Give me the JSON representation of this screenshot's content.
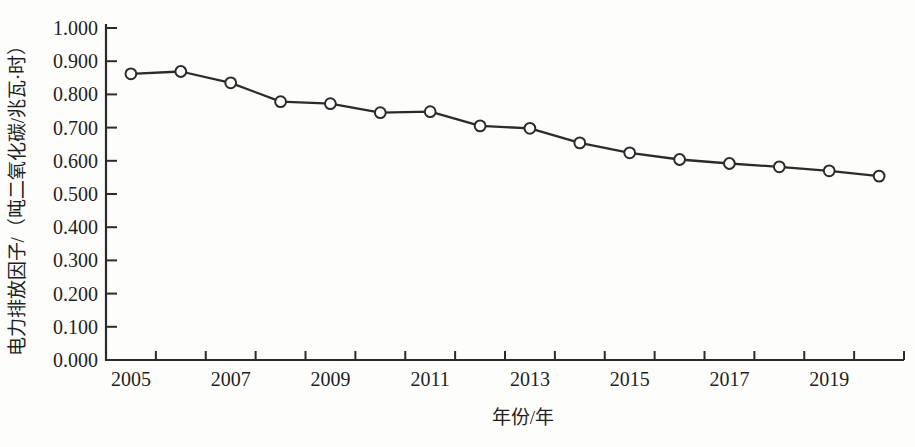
{
  "chart_data": {
    "type": "line",
    "title": "",
    "xlabel": "年份/年",
    "ylabel": "电力排放因子/（吨二氧化碳/兆瓦·时）",
    "categories": [
      2005,
      2006,
      2007,
      2008,
      2009,
      2010,
      2011,
      2012,
      2013,
      2014,
      2015,
      2016,
      2017,
      2018,
      2019,
      2020
    ],
    "series": [
      {
        "name": "电力排放因子",
        "values": [
          0.862,
          0.869,
          0.835,
          0.778,
          0.772,
          0.745,
          0.748,
          0.705,
          0.698,
          0.654,
          0.624,
          0.604,
          0.592,
          0.582,
          0.57,
          0.554
        ]
      }
    ],
    "ylim": [
      0.0,
      1.0
    ],
    "ytick_step": 0.1,
    "ytick_labels": [
      "0.000",
      "0.100",
      "0.200",
      "0.300",
      "0.400",
      "0.500",
      "0.600",
      "0.700",
      "0.800",
      "0.900",
      "1.000"
    ],
    "xtick_labels_shown": [
      "2005",
      "2007",
      "2009",
      "2011",
      "2013",
      "2015",
      "2017",
      "2019"
    ],
    "xtick_label_every": 2,
    "grid": "off",
    "legend": "none",
    "marker": "open-circle",
    "line_color": "#2b2b2b",
    "axis_color": "#2b2b2b",
    "text_color": "#1f1f1f",
    "marker_fill": "#ffffff",
    "background": "#fdfdfc"
  }
}
